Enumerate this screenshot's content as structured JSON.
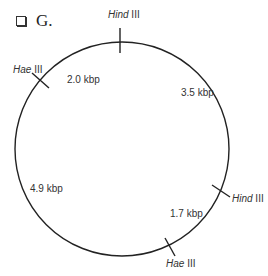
{
  "header": {
    "checkbox_glyph": "❑",
    "title": "G."
  },
  "plasmid_map": {
    "circle": {
      "cx": 122,
      "cy": 149,
      "r": 107,
      "stroke": "#222222"
    },
    "sites": [
      {
        "enzyme_italic": "Hind",
        "enzyme_roman": " III",
        "position": "top"
      },
      {
        "enzyme_italic": "Hae",
        "enzyme_roman": " III",
        "position": "upper-left"
      },
      {
        "enzyme_italic": "Hind",
        "enzyme_roman": " III",
        "position": "right"
      },
      {
        "enzyme_italic": "Hae",
        "enzyme_roman": " III",
        "position": "bottom"
      }
    ],
    "fragments": [
      {
        "label": "2.0 kbp"
      },
      {
        "label": "3.5 kbp"
      },
      {
        "label": "4.9 kbp"
      },
      {
        "label": "1.7 kbp"
      }
    ]
  }
}
